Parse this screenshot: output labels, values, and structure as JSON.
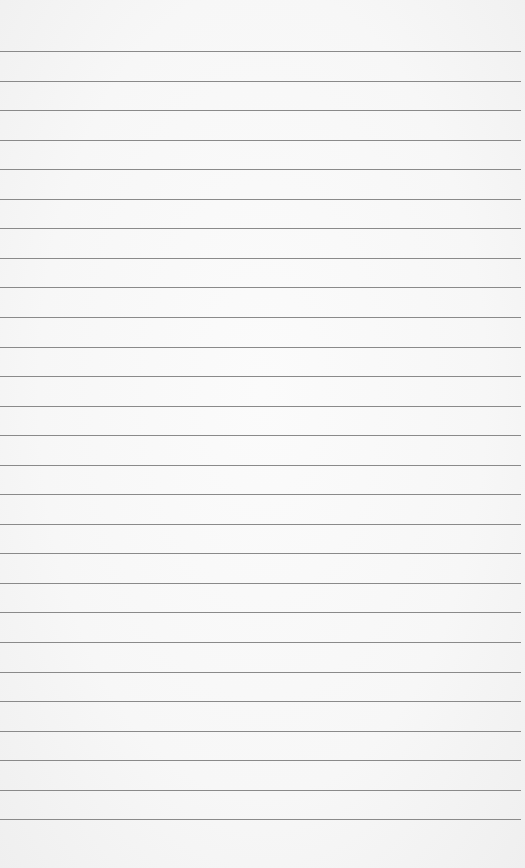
{
  "paper": {
    "background": "#f7f7f7",
    "line_color": "#8a8a8a",
    "first_line_y": 51,
    "line_spacing": 29.55,
    "line_count": 27
  }
}
